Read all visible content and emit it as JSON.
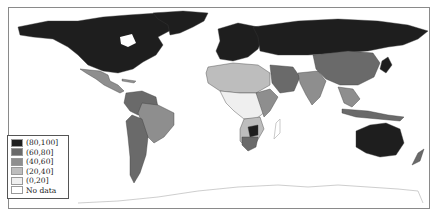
{
  "map": {
    "type": "choropleth",
    "projection": "world",
    "colors": {
      "c80_100": "#1e1e1e",
      "c60_80": "#6a6a6a",
      "c40_60": "#8e8e8e",
      "c20_40": "#bdbdbd",
      "c0_20": "#efefef",
      "no_data": "#ffffff",
      "antarctica_outline": "#c8c8c8",
      "border": "#3a3a3a"
    }
  },
  "legend": {
    "items": [
      {
        "label": "(80,100]",
        "color": "#1e1e1e"
      },
      {
        "label": "(60,80]",
        "color": "#6a6a6a"
      },
      {
        "label": "(40,60]",
        "color": "#8e8e8e"
      },
      {
        "label": "(20,40]",
        "color": "#bdbdbd"
      },
      {
        "label": "(0,20]",
        "color": "#efefef"
      },
      {
        "label": "No data",
        "color": "#ffffff"
      }
    ]
  }
}
